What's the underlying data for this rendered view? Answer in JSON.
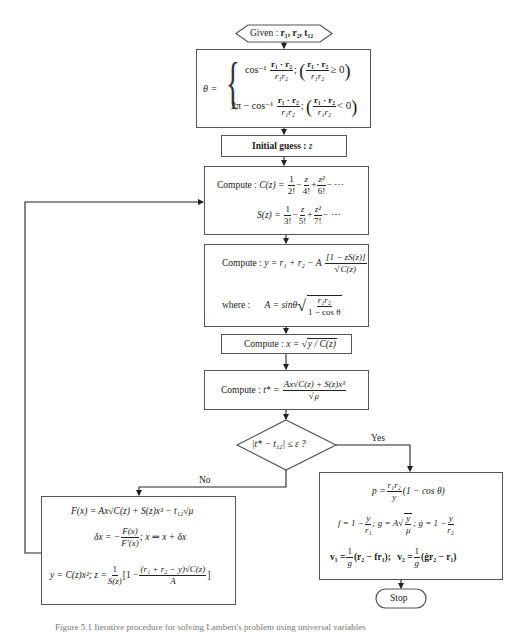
{
  "start": {
    "label": "Given :",
    "vars": "r₁, r₂, t₁₂"
  },
  "theta": {
    "lhs": "θ =",
    "case1_expr": "cos⁻¹",
    "case1_num": "r₁ · r₂",
    "case1_den": "r₁r₂",
    "case1_cond": "≥ 0",
    "case2_expr": "2π − cos⁻¹",
    "case2_num": "r₁ · r₂",
    "case2_den": "r₁r₂",
    "case2_cond": "< 0"
  },
  "initial_guess": {
    "label": "Initial guess :",
    "var": "z"
  },
  "compute_cs": {
    "label": "Compute :",
    "c_lhs": "C(z) =",
    "c_terms": [
      {
        "n": "1",
        "d": "2!"
      },
      {
        "n": "z",
        "d": "4!"
      },
      {
        "n": "z²",
        "d": "6!"
      }
    ],
    "s_lhs": "S(z) =",
    "s_terms": [
      {
        "n": "1",
        "d": "3!"
      },
      {
        "n": "z",
        "d": "5!"
      },
      {
        "n": "z²",
        "d": "7!"
      }
    ],
    "ellipsis": "− ⋯"
  },
  "compute_y": {
    "label": "Compute :",
    "expr": "y = r₁ + r₂ − A",
    "num": "[1 − zS(z)]",
    "den": "C(z)",
    "where_label": "where :",
    "a_expr": "A = sinθ",
    "a_num": "r₁r₂",
    "a_den": "1 − cos θ"
  },
  "compute_x": {
    "label": "Compute :",
    "expr": "x =",
    "radicand": "y / C(z)"
  },
  "compute_t": {
    "label": "Compute :",
    "lhs": "t* =",
    "num": "Ax√C(z) + S(z)x³",
    "den": "μ"
  },
  "decision": {
    "expr": "|t* − t₁₂| ≤ ε ?",
    "yes_label": "Yes",
    "no_label": "No"
  },
  "newton": {
    "line1": "F(x) = Ax√C(z) + S(z)x³ − t₁₂√μ",
    "line2_lhs": "δx = −",
    "line2_num": "F(x)",
    "line2_den": "F′(x)",
    "line2_rhs": ";   x ⇒ x + δx",
    "line3_lhs": "y = C(z)x²;  z =",
    "line3_num": "1",
    "line3_den": "S(z)",
    "line3_bracket": "[1 −",
    "line3_inner_num": "(r₁ + r₂ − y)√C(z)",
    "line3_inner_den": "A",
    "line3_close": "]"
  },
  "result": {
    "p_lhs": "p =",
    "p_num": "r₁r₂",
    "p_den": "y",
    "p_rhs": "(1 − cos θ)",
    "f_expr": "f = 1 −",
    "f_num": "y",
    "f_den": "r₁",
    "g_expr": ";  g = A",
    "g_num": "y",
    "g_den": "μ",
    "gdot_expr": ";  ġ = 1 −",
    "gdot_num": "y",
    "gdot_den": "r₂",
    "v1_lhs": "v₁ =",
    "v1_num": "1",
    "v1_den": "g",
    "v1_rhs": "(r₂ − fr₁);",
    "v2_lhs": "v₂ =",
    "v2_num": "1",
    "v2_den": "g",
    "v2_rhs": "(ġr₂ − r₁)"
  },
  "stop": {
    "label": "Stop"
  },
  "caption": "Figure 5.1  Iterative procedure for solving Lambert's problem using universal variables"
}
